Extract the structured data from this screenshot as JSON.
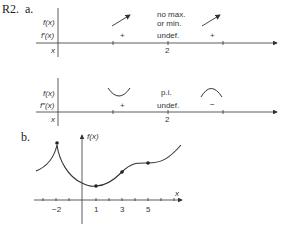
{
  "problem": {
    "number": "R2.",
    "part_a_label": "a.",
    "part_b_label": "b."
  },
  "table_first_derivative": {
    "row_labels": {
      "f": "f(x)",
      "fprime": "f′(x)",
      "x": "x"
    },
    "intervals": [
      {
        "f_behavior": "increasing",
        "sign": "+"
      },
      {
        "f_behavior": "increasing",
        "sign": "+"
      }
    ],
    "critical_point": {
      "x": "2",
      "f_note_line1": "no max.",
      "f_note_line2": "or min.",
      "derivative": "undef."
    }
  },
  "table_second_derivative": {
    "row_labels": {
      "f": "f(x)",
      "fdoubleprime": "f″(x)",
      "x": "x"
    },
    "intervals": [
      {
        "f_behavior": "concave-up",
        "sign": "+"
      },
      {
        "f_behavior": "concave-down",
        "sign": "−"
      }
    ],
    "critical_point": {
      "x": "2",
      "f_note": "p.i.",
      "derivative": "undef."
    }
  },
  "graph": {
    "y_axis_label": "f(x)",
    "x_axis_label": "x",
    "x_tick_labels": [
      "−2",
      "1",
      "3",
      "5"
    ],
    "marked_points": [
      {
        "x": -2,
        "type": "cusp-maximum"
      },
      {
        "x": 1,
        "type": "minimum"
      },
      {
        "x": 3,
        "type": "inflection"
      },
      {
        "x": 5,
        "type": "inflection"
      }
    ]
  }
}
